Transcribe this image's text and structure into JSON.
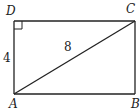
{
  "diagram": {
    "type": "rectangle-with-diagonal",
    "vertices": {
      "A": {
        "label": "A",
        "x": 14,
        "y": 94
      },
      "B": {
        "label": "B",
        "x": 135,
        "y": 94
      },
      "C": {
        "label": "C",
        "x": 135,
        "y": 21
      },
      "D": {
        "label": "D",
        "x": 14,
        "y": 21
      }
    },
    "right_angle_at": "D",
    "measures": {
      "AD": "4",
      "AC": "8"
    },
    "colors": {
      "stroke": "#222222",
      "background": "#ffffff"
    }
  }
}
